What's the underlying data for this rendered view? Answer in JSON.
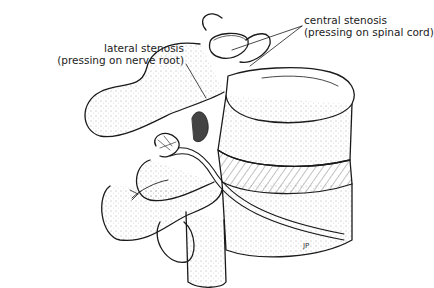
{
  "figure": {
    "labels": {
      "central": {
        "line1": "central stenosis",
        "line2": "(pressing on spinal cord)"
      },
      "lateral": {
        "line1": "lateral stenosis",
        "line2": "(pressing on nerve root)"
      }
    },
    "signature": "JP",
    "colors": {
      "ink": "#1a1a1a",
      "background": "#ffffff"
    }
  }
}
